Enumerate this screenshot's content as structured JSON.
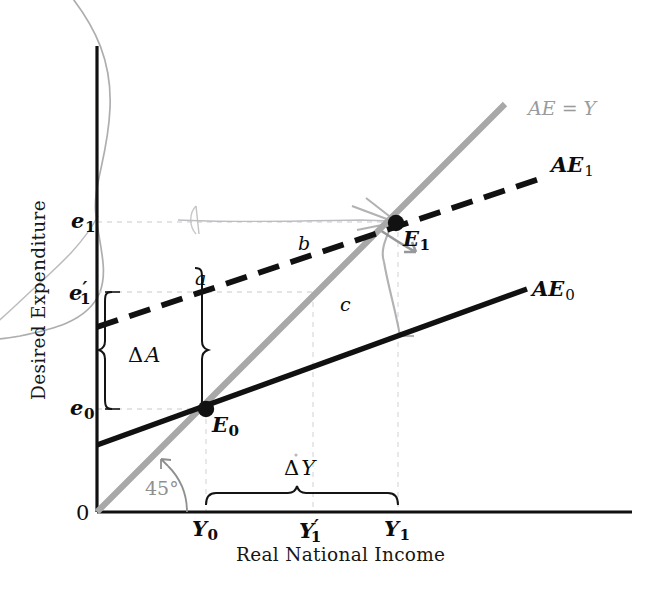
{
  "figure": {
    "domain": "economics-45-degree-aggregate-expenditure-diagram",
    "axes": {
      "x_title": "Real National Income",
      "y_title": "Desired Expenditure",
      "origin_label": "0"
    },
    "x_ticks": [
      {
        "id": "Y0",
        "base": "Y",
        "sub": "0",
        "prime": "",
        "x": 206
      },
      {
        "id": "Y1p",
        "base": "Y",
        "sub": "1",
        "prime": "′",
        "x": 313
      },
      {
        "id": "Y1",
        "base": "Y",
        "sub": "1",
        "prime": "",
        "x": 398
      }
    ],
    "y_ticks": [
      {
        "id": "e1",
        "base": "e",
        "sub": "1",
        "prime": "",
        "y": 222
      },
      {
        "id": "e1p",
        "base": "e",
        "sub": "1",
        "prime": "′",
        "y": 292
      },
      {
        "id": "e0",
        "base": "e",
        "sub": "0",
        "prime": "",
        "y": 409
      }
    ],
    "curves": [
      {
        "id": "ae_y",
        "label_base": "AE = Y",
        "label_sub": "",
        "style": "solid-grey",
        "color": "#a8a8a8"
      },
      {
        "id": "ae_1",
        "label_base": "AE",
        "label_sub": "1",
        "style": "dashed-black",
        "color": "#111111"
      },
      {
        "id": "ae_0",
        "label_base": "AE",
        "label_sub": "0",
        "style": "solid-black",
        "color": "#111111"
      }
    ],
    "points": [
      {
        "id": "E0",
        "base": "E",
        "sub": "0",
        "x": 206,
        "y": 409
      },
      {
        "id": "E1",
        "base": "E",
        "sub": "1",
        "x": 396,
        "y": 223
      }
    ],
    "area_labels": [
      {
        "id": "a",
        "text": "a",
        "x": 195,
        "y": 269
      },
      {
        "id": "b",
        "text": "b",
        "x": 298,
        "y": 234
      },
      {
        "id": "c",
        "text": "c",
        "x": 340,
        "y": 295
      }
    ],
    "braces": [
      {
        "id": "delta_a",
        "delta": "Δ",
        "variable": "A",
        "label_x": 128,
        "label_y": 345,
        "orientation": "vertical"
      },
      {
        "id": "delta_y",
        "delta": "Δ",
        "variable": "Y",
        "label_x": 284,
        "label_y": 458,
        "orientation": "horizontal"
      }
    ],
    "angle": {
      "label": "45°",
      "x": 145,
      "y": 479,
      "color": "#8f8f8f"
    },
    "colors": {
      "ink": "#111111",
      "grey_line": "#a8a8a8",
      "pencil": "#a9a9a9",
      "guide": "#d8d8dc",
      "paper": "#ffffff"
    }
  }
}
